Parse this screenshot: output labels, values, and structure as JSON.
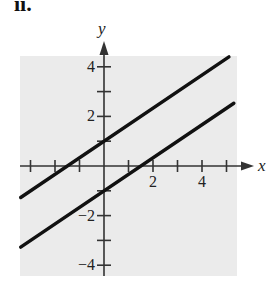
{
  "part_label": "ii.",
  "chart_data": {
    "type": "line",
    "title": "",
    "xlabel": "x",
    "ylabel": "y",
    "xlim": [
      -3.4,
      5.4
    ],
    "ylim": [
      -4.4,
      4.5
    ],
    "x_ticks": [
      -3,
      -2,
      -1,
      1,
      2,
      3,
      4,
      5
    ],
    "x_tick_labels": [
      "2",
      "4"
    ],
    "x_tick_label_values": [
      2,
      4
    ],
    "y_ticks": [
      -4,
      -3,
      -2,
      -1,
      1,
      2,
      3,
      4
    ],
    "y_tick_labels": [
      "4",
      "2",
      "−2",
      "−4"
    ],
    "y_tick_label_values": [
      4,
      2,
      -2,
      -4
    ],
    "grid": false,
    "background": "#ebebeb",
    "legend": null,
    "series": [
      {
        "name": "upper line",
        "equation": "y = (2/3)x + 1",
        "slope": 0.667,
        "intercept": 1,
        "x": [
          -3.4,
          5.1
        ],
        "y": [
          -1.27,
          4.4
        ],
        "color": "#111111"
      },
      {
        "name": "lower line",
        "equation": "y = (2/3)x - 1",
        "slope": 0.667,
        "intercept": -1,
        "x": [
          -3.4,
          5.3
        ],
        "y": [
          -3.27,
          2.53
        ],
        "color": "#111111"
      }
    ]
  }
}
